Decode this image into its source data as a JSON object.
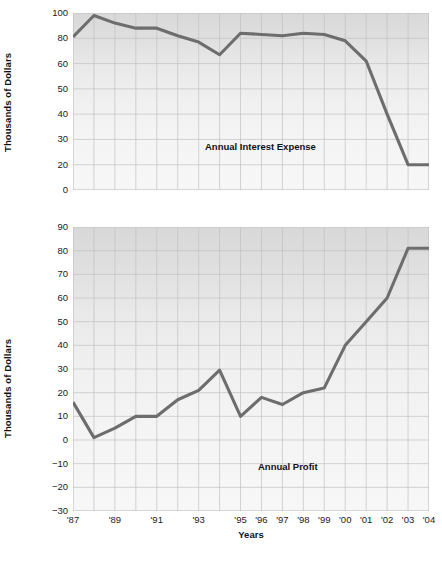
{
  "chart_data": [
    {
      "type": "line",
      "id": "annual-interest-expense",
      "title": "Annual Interest Expense",
      "xlabel": "",
      "ylabel": "Thousands of Dollars",
      "ytick_labels": [
        "100",
        "80",
        "60",
        "50",
        "40",
        "30",
        "20",
        "0"
      ],
      "ylim": [
        0,
        100
      ],
      "grid": true,
      "legend": "none",
      "annotation": "Annual Interest Expense",
      "x": [
        "'87",
        "'88",
        "'89",
        "'90",
        "'91",
        "'92",
        "'93",
        "'94",
        "'95",
        "'96",
        "'97",
        "'98",
        "'99",
        "'00",
        "'01",
        "'02",
        "'03",
        "'04"
      ],
      "values": [
        81,
        98,
        92,
        88,
        88,
        82,
        77,
        67,
        84,
        83,
        82,
        84,
        83,
        78,
        62,
        40,
        20,
        20
      ],
      "line_color": "#6d6d6d"
    },
    {
      "type": "line",
      "id": "annual-profit",
      "title": "Annual Profit",
      "xlabel": "Years",
      "ylabel": "Thousands of Dollars",
      "ytick_labels": [
        "90",
        "80",
        "70",
        "60",
        "50",
        "40",
        "30",
        "20",
        "10",
        "0",
        "−10",
        "−20",
        "−30"
      ],
      "ylim": [
        -30,
        90
      ],
      "grid": true,
      "legend": "none",
      "annotation": "Annual Profit",
      "x": [
        "'87",
        "'88",
        "'89",
        "'90",
        "'91",
        "'92",
        "'93",
        "'94",
        "'95",
        "'96",
        "'97",
        "'98",
        "'99",
        "'00",
        "'01",
        "'02",
        "'03",
        "'04"
      ],
      "values": [
        16,
        1,
        5,
        10,
        10,
        17,
        21,
        29.5,
        10,
        18,
        15,
        20,
        22,
        40,
        50,
        60,
        81,
        81
      ],
      "line_color": "#6d6d6d"
    }
  ],
  "axis": {
    "x_tick_labels": [
      "'87",
      "'89",
      "'91",
      "'93",
      "'95",
      "'96",
      "'97",
      "'98",
      "'99",
      "'00",
      "'01",
      "'02",
      "'03",
      "'04"
    ],
    "x_axis_title": "Years",
    "y_axis_title": "Thousands of Dollars"
  },
  "colors": {
    "line": "#6d6d6d",
    "grid": "#c2c2c2",
    "plot_bg_top": "#d8d8d8",
    "plot_bg_bottom": "#f7f7f7",
    "text": "#1a1a1a"
  }
}
